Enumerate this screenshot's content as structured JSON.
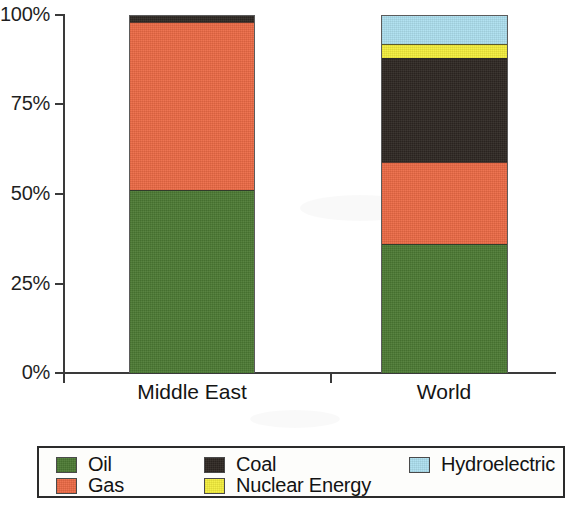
{
  "chart_data": {
    "type": "bar",
    "subtype": "stacked-percentage",
    "title": "",
    "subtitle": "",
    "xlabel": "",
    "ylabel": "",
    "categories": [
      "Middle East",
      "World"
    ],
    "ylim": [
      0,
      100
    ],
    "yticks": [
      0,
      25,
      50,
      75,
      100
    ],
    "ytick_labels": [
      "0%",
      "25%",
      "50%",
      "75%",
      "100%"
    ],
    "grid": false,
    "legend_position": "bottom",
    "stack_order_bottom_to_top": [
      "Oil",
      "Gas",
      "Coal",
      "Nuclear Energy",
      "Hydroelectric"
    ],
    "series": [
      {
        "name": "Oil",
        "color": "#4c7a33",
        "values": [
          51,
          36
        ]
      },
      {
        "name": "Gas",
        "color": "#ec6a45",
        "values": [
          47,
          23
        ]
      },
      {
        "name": "Coal",
        "color": "#2e2722",
        "values": [
          2,
          29
        ]
      },
      {
        "name": "Nuclear Energy",
        "color": "#f4ee3c",
        "values": [
          0,
          4
        ]
      },
      {
        "name": "Hydroelectric",
        "color": "#ade0ef",
        "values": [
          0,
          8
        ]
      }
    ],
    "annotations": []
  },
  "axis": {
    "y_ticks": [
      {
        "label": "100%",
        "value": 100
      },
      {
        "label": "75%",
        "value": 75
      },
      {
        "label": "50%",
        "value": 50
      },
      {
        "label": "25%",
        "value": 25
      },
      {
        "label": "0%",
        "value": 0
      }
    ],
    "x_categories": [
      {
        "label": "Middle East"
      },
      {
        "label": "World"
      }
    ]
  },
  "legend": {
    "entries": [
      {
        "label": "Oil",
        "color": "#4c7a33"
      },
      {
        "label": "Gas",
        "color": "#ec6a45"
      },
      {
        "label": "Coal",
        "color": "#2e2722"
      },
      {
        "label": "Nuclear Energy",
        "color": "#f4ee3c"
      },
      {
        "label": "Hydroelectric",
        "color": "#ade0ef"
      }
    ]
  }
}
